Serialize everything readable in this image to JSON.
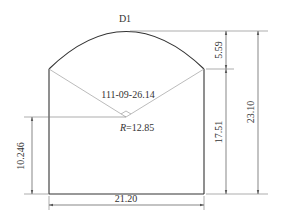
{
  "diagram": {
    "title": "D1",
    "colors": {
      "outline": "#333333",
      "construction": "#aaaaaa",
      "dimension": "#555555",
      "text": "#333333",
      "background": "#ffffff"
    },
    "labels": {
      "angle": "111-09-26.14",
      "radius_symbol": "R",
      "radius_value": "=12.85",
      "center_height": "10.246",
      "width": "21.20",
      "arch_rise": "5.59",
      "wall_height": "17.51",
      "total_height": "23.10"
    }
  }
}
